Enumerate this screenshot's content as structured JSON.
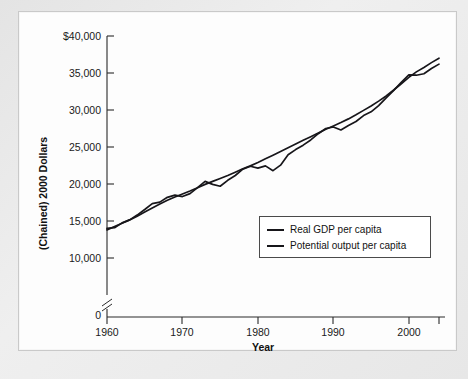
{
  "figure": {
    "source_note": ""
  },
  "axes": {
    "y_title": "(Chained) 2000 Dollars",
    "x_title": "Year",
    "y_ticks": [
      "$40,000",
      "35,000",
      "30,000",
      "25,000",
      "20,000",
      "15,000",
      "10,000",
      "0"
    ],
    "x_ticks": [
      "1960",
      "1970",
      "1980",
      "1990",
      "2000"
    ],
    "axis_break_symbol": "//"
  },
  "legend": {
    "items": [
      {
        "label": "Real GDP per capita",
        "color": "#17161a"
      },
      {
        "label": "Potential output per capita",
        "color": "#17161a"
      }
    ]
  },
  "chart_data": {
    "type": "line",
    "title": "",
    "subtitle": "",
    "xlabel": "Year",
    "ylabel": "(Chained) 2000 Dollars",
    "xlim": [
      1960,
      2004
    ],
    "ylim": [
      10000,
      40000
    ],
    "y_axis_broken_below": 10000,
    "y_tick_values": [
      10000,
      15000,
      20000,
      25000,
      30000,
      35000,
      40000
    ],
    "x_tick_values": [
      1960,
      1970,
      1980,
      1990,
      2000
    ],
    "grid": false,
    "legend_position": "lower-right",
    "x": [
      1960,
      1961,
      1962,
      1963,
      1964,
      1965,
      1966,
      1967,
      1968,
      1969,
      1970,
      1971,
      1972,
      1973,
      1974,
      1975,
      1976,
      1977,
      1978,
      1979,
      1980,
      1981,
      1982,
      1983,
      1984,
      1985,
      1986,
      1987,
      1988,
      1989,
      1990,
      1991,
      1992,
      1993,
      1994,
      1995,
      1996,
      1997,
      1998,
      1999,
      2000,
      2001,
      2002,
      2003,
      2004
    ],
    "series": [
      {
        "name": "Real GDP per capita",
        "color": "#17161a",
        "values": [
          14000,
          14100,
          14750,
          15150,
          15800,
          16550,
          17350,
          17550,
          18200,
          18500,
          18300,
          18700,
          19500,
          20350,
          19950,
          19700,
          20500,
          21150,
          22000,
          22400,
          22150,
          22450,
          21800,
          22550,
          23950,
          24650,
          25250,
          25950,
          26800,
          27500,
          27700,
          27300,
          27900,
          28450,
          29250,
          29750,
          30600,
          31650,
          32650,
          33750,
          34750,
          34700,
          34900,
          35600,
          36200
        ]
      },
      {
        "name": "Potential output per capita",
        "color": "#17161a",
        "values": [
          13800,
          14250,
          14700,
          15150,
          15650,
          16200,
          16750,
          17300,
          17800,
          18250,
          18650,
          19050,
          19500,
          19950,
          20350,
          20750,
          21150,
          21600,
          22050,
          22450,
          22900,
          23400,
          23900,
          24400,
          24900,
          25400,
          25900,
          26400,
          26900,
          27400,
          27850,
          28300,
          28800,
          29350,
          29950,
          30550,
          31200,
          31900,
          32700,
          33550,
          34400,
          35150,
          35750,
          36400,
          37000
        ]
      }
    ],
    "annotations": [
      {
        "text": "recession dip",
        "x": 1975
      },
      {
        "text": "recession dip",
        "x": 1982
      },
      {
        "text": "recession dip",
        "x": 1991
      }
    ]
  }
}
